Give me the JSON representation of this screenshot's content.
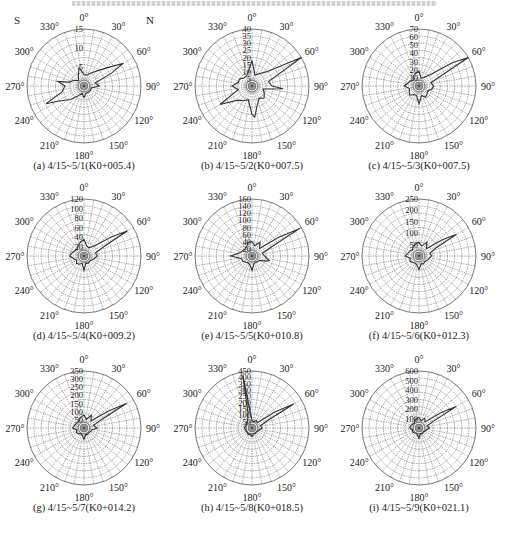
{
  "figure": {
    "top_caption_visible": true,
    "top_caption_text": "",
    "colors": {
      "grid": "#555555",
      "series": "#333333",
      "background": "#ffffff"
    },
    "angle_labels": [
      "0°",
      "30°",
      "60°",
      "90°",
      "120°",
      "150°",
      "180°",
      "210°",
      "240°",
      "270°",
      "300°",
      "330°"
    ],
    "corner_labels": {
      "left": "S",
      "right": "N"
    }
  },
  "chart_data": [
    {
      "type": "polar_rose",
      "id": "a",
      "caption": "(a)  4/15~5/1(K0+005.4)",
      "rmax": 15,
      "rticks": [
        5,
        10,
        15
      ],
      "show_corner_labels": true,
      "angles_deg": [
        0,
        15,
        30,
        45,
        55,
        60,
        65,
        75,
        90,
        105,
        120,
        135,
        150,
        165,
        180,
        195,
        210,
        225,
        240,
        245,
        255,
        270,
        280,
        285,
        300,
        315,
        330,
        345
      ],
      "values": [
        3,
        3,
        4,
        6,
        9,
        12,
        8,
        3,
        4,
        2,
        2,
        2,
        2,
        2,
        3,
        2,
        3,
        5,
        8,
        11,
        6,
        5,
        7,
        4,
        3,
        2,
        3,
        5
      ]
    },
    {
      "type": "polar_rose",
      "id": "b",
      "caption": "(b)  4/15~5/2(K0+007.5)",
      "rmax": 40,
      "rticks": [
        5,
        10,
        15,
        20,
        25,
        30,
        35,
        40
      ],
      "show_corner_labels": false,
      "angles_deg": [
        0,
        15,
        30,
        45,
        60,
        75,
        90,
        95,
        105,
        120,
        135,
        150,
        165,
        175,
        180,
        195,
        210,
        225,
        240,
        255,
        270,
        285,
        300,
        315,
        330,
        345
      ],
      "values": [
        18,
        8,
        10,
        14,
        40,
        12,
        14,
        22,
        8,
        10,
        12,
        10,
        14,
        22,
        20,
        10,
        12,
        14,
        26,
        10,
        14,
        10,
        10,
        8,
        8,
        10
      ]
    },
    {
      "type": "polar_rose",
      "id": "c",
      "caption": "(c)  4/15~5/3(K0+007.5)",
      "rmax": 70,
      "rticks": [
        10,
        20,
        30,
        40,
        50,
        60,
        70
      ],
      "show_corner_labels": false,
      "angles_deg": [
        0,
        15,
        30,
        45,
        55,
        60,
        65,
        75,
        90,
        105,
        120,
        135,
        150,
        165,
        180,
        195,
        210,
        225,
        240,
        255,
        270,
        285,
        300,
        315,
        330,
        345
      ],
      "values": [
        18,
        10,
        12,
        20,
        50,
        70,
        30,
        15,
        18,
        16,
        12,
        14,
        16,
        12,
        22,
        12,
        12,
        16,
        14,
        12,
        18,
        14,
        12,
        10,
        14,
        16
      ]
    },
    {
      "type": "polar_rose",
      "id": "d",
      "caption": "(d)  4/15~5/4(K0+009.2)",
      "rmax": 120,
      "rticks": [
        20,
        40,
        60,
        80,
        100,
        120
      ],
      "show_corner_labels": false,
      "angles_deg": [
        0,
        15,
        30,
        45,
        55,
        60,
        65,
        75,
        90,
        105,
        120,
        135,
        150,
        165,
        180,
        195,
        210,
        225,
        240,
        255,
        270,
        285,
        300,
        315,
        330,
        345
      ],
      "values": [
        35,
        22,
        20,
        30,
        70,
        105,
        45,
        25,
        28,
        22,
        18,
        16,
        18,
        15,
        30,
        16,
        20,
        22,
        18,
        22,
        30,
        26,
        22,
        20,
        25,
        30
      ]
    },
    {
      "type": "polar_rose",
      "id": "e",
      "caption": "(e)  4/15~5/5(K0+010.8)",
      "rmax": 160,
      "rticks": [
        20,
        40,
        60,
        80,
        100,
        120,
        140,
        160
      ],
      "show_corner_labels": false,
      "angles_deg": [
        0,
        15,
        30,
        45,
        55,
        60,
        65,
        75,
        90,
        105,
        110,
        120,
        135,
        150,
        165,
        180,
        195,
        210,
        225,
        240,
        255,
        270,
        285,
        300,
        315,
        330,
        345
      ],
      "values": [
        40,
        30,
        45,
        30,
        90,
        155,
        60,
        30,
        35,
        50,
        40,
        25,
        22,
        20,
        22,
        40,
        25,
        22,
        25,
        30,
        30,
        60,
        35,
        30,
        28,
        30,
        40
      ]
    },
    {
      "type": "polar_rose",
      "id": "f",
      "caption": "(f)  4/15~5/6(K0+012.3)",
      "rmax": 250,
      "rticks": [
        50,
        100,
        150,
        200,
        250
      ],
      "show_corner_labels": false,
      "angles_deg": [
        0,
        15,
        30,
        45,
        55,
        60,
        65,
        75,
        90,
        105,
        120,
        135,
        150,
        165,
        180,
        195,
        210,
        225,
        240,
        255,
        270,
        285,
        300,
        315,
        330,
        345
      ],
      "values": [
        60,
        45,
        70,
        45,
        120,
        190,
        80,
        50,
        55,
        45,
        40,
        35,
        40,
        35,
        60,
        40,
        35,
        40,
        45,
        40,
        60,
        50,
        45,
        40,
        50,
        55
      ]
    },
    {
      "type": "polar_rose",
      "id": "g",
      "caption": "(g)  4/15~5/7(K0+014.2)",
      "rmax": 350,
      "rticks": [
        50,
        100,
        150,
        200,
        250,
        300,
        350
      ],
      "show_corner_labels": false,
      "angles_deg": [
        0,
        15,
        30,
        45,
        55,
        60,
        65,
        75,
        90,
        105,
        120,
        135,
        150,
        165,
        180,
        195,
        210,
        225,
        240,
        255,
        270,
        285,
        300,
        315,
        330,
        345
      ],
      "values": [
        80,
        55,
        90,
        60,
        180,
        300,
        110,
        60,
        80,
        50,
        45,
        40,
        45,
        40,
        70,
        45,
        40,
        50,
        55,
        45,
        70,
        60,
        55,
        50,
        60,
        70
      ]
    },
    {
      "type": "polar_rose",
      "id": "h",
      "caption": "(h)  4/15~5/8(K0+018.5)",
      "rmax": 450,
      "rticks": [
        50,
        100,
        150,
        200,
        250,
        300,
        350,
        400,
        450
      ],
      "show_corner_labels": false,
      "angles_deg": [
        0,
        15,
        30,
        45,
        55,
        60,
        65,
        75,
        90,
        105,
        120,
        135,
        150,
        165,
        180,
        195,
        210,
        225,
        240,
        255,
        270,
        285,
        300,
        315,
        330,
        345,
        350
      ],
      "values": [
        60,
        50,
        70,
        60,
        220,
        380,
        130,
        70,
        80,
        60,
        50,
        45,
        50,
        45,
        70,
        50,
        60,
        50,
        55,
        50,
        60,
        55,
        50,
        60,
        70,
        120,
        420
      ]
    },
    {
      "type": "polar_rose",
      "id": "i",
      "caption": "(i)  4/15~5/9(K0+021.1)",
      "rmax": 600,
      "rticks": [
        100,
        200,
        300,
        400,
        500,
        600
      ],
      "show_corner_labels": false,
      "angles_deg": [
        0,
        15,
        30,
        45,
        55,
        60,
        65,
        75,
        90,
        105,
        120,
        135,
        150,
        165,
        180,
        195,
        210,
        225,
        240,
        255,
        270,
        285,
        300,
        315,
        330,
        345
      ],
      "values": [
        110,
        80,
        120,
        90,
        280,
        450,
        160,
        90,
        110,
        80,
        70,
        60,
        70,
        60,
        110,
        70,
        60,
        70,
        80,
        70,
        100,
        90,
        80,
        70,
        90,
        100
      ]
    }
  ]
}
